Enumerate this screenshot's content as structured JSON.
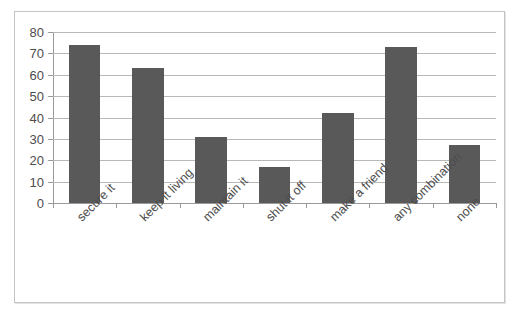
{
  "chart_data": {
    "type": "bar",
    "title": "",
    "subtitle": "",
    "xlabel": "",
    "ylabel": "",
    "categories": [
      "secure it",
      "keep it living",
      "maintain it",
      "shut it off",
      "make a friend",
      "any combination",
      "none"
    ],
    "values": [
      74,
      63,
      31,
      17,
      42,
      73,
      27
    ],
    "ylim": [
      0,
      80
    ],
    "ytick_step": 10,
    "ytick_labels": [
      "0",
      "10",
      "20",
      "30",
      "40",
      "50",
      "60",
      "70",
      "80"
    ],
    "grid": true,
    "legend": false,
    "legend_position": "none",
    "bar_color": "#595959",
    "gridline_color": "#b8b8b8",
    "axis_color": "#9a9a9a",
    "frame_border_color": "#c4c4c4",
    "background_color": "#ffffff",
    "text_color": "#4d4d4d",
    "xtick_label_rotation": -45
  }
}
